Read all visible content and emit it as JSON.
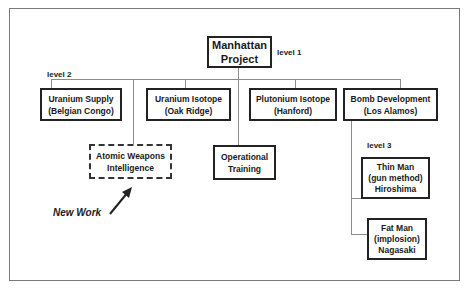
{
  "diagram": {
    "root": {
      "line1": "Manhattan",
      "line2": "Project"
    },
    "level_labels": {
      "level1": "level 1",
      "level2": "level 2",
      "level3": "level 3"
    },
    "level2_nodes": [
      {
        "line1": "Uranium Supply",
        "line2": "(Belgian Congo)"
      },
      {
        "line1": "Uranium Isotope",
        "line2": "(Oak Ridge)"
      },
      {
        "line1": "Plutonium Isotope",
        "line2": "(Hanford)"
      },
      {
        "line1": "Bomb Development",
        "line2": "(Los Alamos)"
      }
    ],
    "new_nodes": [
      {
        "line1": "Atomic Weapons",
        "line2": "Intelligence",
        "style": "dashed"
      },
      {
        "line1": "Operational",
        "line2": "Training",
        "style": "solid"
      }
    ],
    "level3_nodes": [
      {
        "line1": "Thin Man",
        "line2": "(gun method)",
        "line3": "Hiroshima"
      },
      {
        "line1": "Fat Man",
        "line2": "(implosion)",
        "line3": "Nagasaki"
      }
    ],
    "annotation": {
      "text": "New Work",
      "icon": "arrow-up-right-icon"
    }
  }
}
